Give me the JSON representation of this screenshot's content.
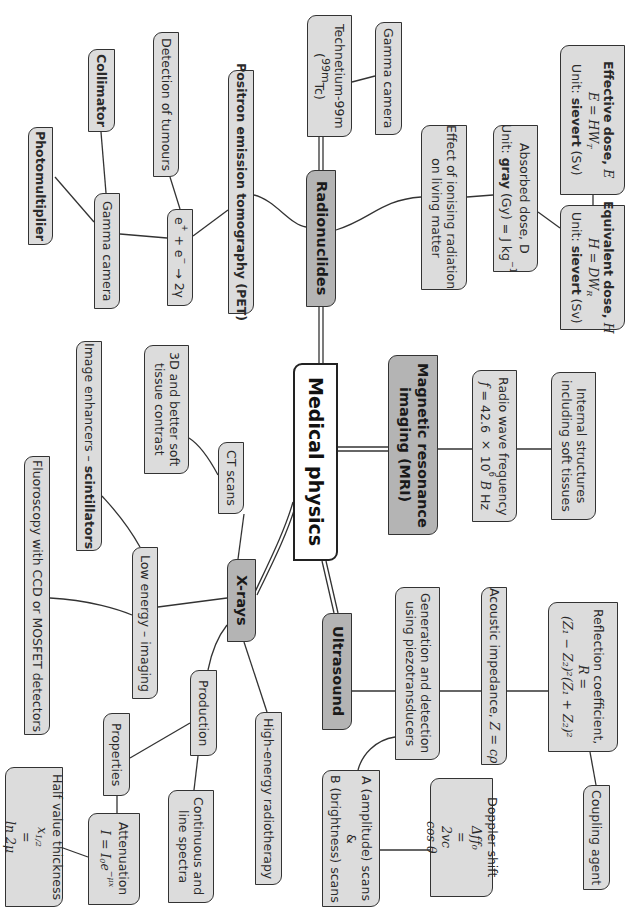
{
  "title": "Medical physics",
  "colors": {
    "root_fill": "#ffffff",
    "topic_fill": "#b4b4b4",
    "leaf_fill": "#dcdcdc",
    "border": "#333333",
    "line": "#333333",
    "background": "#ffffff"
  },
  "text_orientation": "rotated 90 degrees clockwise",
  "root": {
    "label": "Medical physics"
  },
  "branches": {
    "radionuclides": {
      "label": "Radionuclides",
      "technetium": {
        "line1": "Technetium-99m",
        "line2_open": "(",
        "line2_sup": "99m",
        "line2_rest": "Tc)"
      },
      "gamma_camera_top": "Gamma camera",
      "effect": {
        "line1": "Effect of ionising radiation",
        "line2": "on living matter"
      },
      "absorbed": {
        "line1": "Absorbed dose, D",
        "unit_prefix": "Unit: ",
        "unit_bold": "gray",
        "unit_rest": " (Gy) = J kg",
        "unit_sup": "−1"
      },
      "effective": {
        "title": "Effective dose, ",
        "symbol": "E",
        "formula": "E = HW",
        "formula_sub": "T",
        "unit_prefix": "Unit: ",
        "unit_bold": "sievert",
        "unit_rest": " (Sv)"
      },
      "equivalent": {
        "title": "Equivalent dose, ",
        "symbol": "H",
        "formula": "H = DW",
        "formula_sub": "R",
        "unit_prefix": "Unit: ",
        "unit_bold": "sievert",
        "unit_rest": " (Sv)"
      },
      "pet": {
        "label": "Positron emission tomography (PET)",
        "annihilation": {
          "e1": "e",
          "s1": "+",
          "plus": " + e",
          "s2": "−",
          "arrow": " → 2γ"
        },
        "detection": "Detection of tumours",
        "gamma_camera": "Gamma camera",
        "collimator": "Collimator",
        "photomultiplier": "Photomultiplier"
      }
    },
    "mri": {
      "label_line1": "Magnetic resonance",
      "label_line2": "imaging (MRI)",
      "radio_wave": {
        "line1": "Radio wave frequency",
        "f": "f",
        "eq": " = 42.6 × 10",
        "sup": "6",
        "b": " B",
        "hz": " Hz"
      },
      "internal": {
        "line1": "Internal structures",
        "line2": "including soft tissues"
      }
    },
    "ultrasound": {
      "label": "Ultrasound",
      "generation": {
        "line1": "Generation and detection",
        "line2": "using piezotransducers"
      },
      "acoustic": {
        "text": "Acoustic impedance, ",
        "formula": "Z = cρ"
      },
      "reflection": {
        "line1": "Reflection coefficient,",
        "lhs": "R = ",
        "numerator": "(Z₁ − Z₂)²",
        "denominator": "(Z₁ + Z₂)²"
      },
      "coupling": "Coupling agent",
      "scans": {
        "line1": "A (amplitude) scans",
        "line2": "&",
        "line3": "B (brightness) scans"
      },
      "doppler": {
        "line1": "Doppler shift",
        "lhs_num": "Δf",
        "lhs_den": "f₀",
        "eq": " = ",
        "rhs_num": "2v",
        "rhs_den": "c",
        "cos": " cos θ"
      }
    },
    "xrays": {
      "label": "X-rays",
      "ct_scans": "CT scans",
      "ct_detail": {
        "line1": "3D and better soft",
        "line2": "tissue contrast"
      },
      "low_energy": "Low energy – imaging",
      "image_enhancers": {
        "text": "Image enhancers – ",
        "bold": "scintillators"
      },
      "fluoroscopy": "Fluoroscopy with CCD or MOSFET detectors",
      "high_energy": "High-energy radiotherapy",
      "production": "Production",
      "spectra": {
        "line1": "Continuous and",
        "line2": "line spectra"
      },
      "properties": "Properties",
      "attenuation": {
        "line1": "Attenuation",
        "formula": "I = I",
        "sub": "0",
        "e": "e",
        "sup": "−μx"
      },
      "half_value": {
        "line1": "Half value thickness",
        "lhs": "x",
        "lhs_sub": "1/2",
        "eq": " = ",
        "num": "ln 2",
        "den": "μ"
      }
    }
  }
}
